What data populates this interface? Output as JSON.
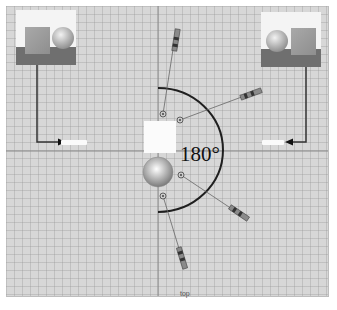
{
  "viewport": {
    "view_name": "top",
    "angle_label": "180°",
    "background": "#d7d7d7",
    "grid_color": "#969696",
    "axis_color": "#8a8a8a"
  },
  "thumbnails": [
    {
      "name": "left",
      "objects": [
        "cube",
        "sphere"
      ]
    },
    {
      "name": "right",
      "objects": [
        "sphere",
        "cube"
      ]
    }
  ],
  "axis_tags": {
    "left": "axis label",
    "right": "axis label"
  },
  "manipulators": [
    {
      "name": "handle-up"
    },
    {
      "name": "handle-upper-right"
    },
    {
      "name": "handle-lower-right"
    },
    {
      "name": "handle-down"
    }
  ],
  "caption": "caption text"
}
